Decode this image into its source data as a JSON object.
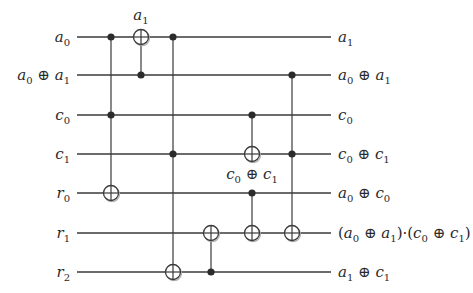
{
  "diagram": {
    "type": "reversible-logic-circuit",
    "wire_x_start": 77,
    "wire_x_end": 331,
    "wires": [
      {
        "id": "w0",
        "y": 37,
        "input": [
          {
            "v": "a",
            "s": "0"
          }
        ],
        "output": [
          {
            "v": "a",
            "s": "1"
          }
        ]
      },
      {
        "id": "w1",
        "y": 75,
        "input": [
          {
            "v": "a",
            "s": "0"
          },
          {
            "op": "⊕"
          },
          {
            "v": "a",
            "s": "1"
          }
        ],
        "output": [
          {
            "v": "a",
            "s": "0"
          },
          {
            "op": "⊕"
          },
          {
            "v": "a",
            "s": "1"
          }
        ]
      },
      {
        "id": "w2",
        "y": 115,
        "input": [
          {
            "v": "c",
            "s": "0"
          }
        ],
        "output": [
          {
            "v": "c",
            "s": "0"
          }
        ]
      },
      {
        "id": "w3",
        "y": 154,
        "input": [
          {
            "v": "c",
            "s": "1"
          }
        ],
        "output": [
          {
            "v": "c",
            "s": "0"
          },
          {
            "op": "⊕"
          },
          {
            "v": "c",
            "s": "1"
          }
        ]
      },
      {
        "id": "w4",
        "y": 193,
        "input": [
          {
            "v": "r",
            "s": "0"
          }
        ],
        "output": [
          {
            "v": "a",
            "s": "0"
          },
          {
            "op": "⊕"
          },
          {
            "v": "c",
            "s": "0"
          }
        ]
      },
      {
        "id": "w5",
        "y": 233,
        "input": [
          {
            "v": "r",
            "s": "1"
          }
        ],
        "output": [
          {
            "op": "("
          },
          {
            "v": "a",
            "s": "0"
          },
          {
            "op": "⊕"
          },
          {
            "v": "a",
            "s": "1"
          },
          {
            "op": ")·("
          },
          {
            "v": "c",
            "s": "0"
          },
          {
            "op": "⊕"
          },
          {
            "v": "c",
            "s": "1"
          },
          {
            "op": ")"
          }
        ]
      },
      {
        "id": "w6",
        "y": 272,
        "input": [
          {
            "v": "r",
            "s": "2"
          }
        ],
        "output": [
          {
            "v": "a",
            "s": "1"
          },
          {
            "op": "⊕"
          },
          {
            "v": "c",
            "s": "1"
          }
        ]
      }
    ],
    "gates": [
      {
        "name": "toffoli-1",
        "x": 111,
        "controls": [
          0,
          2
        ],
        "target": 4
      },
      {
        "name": "cnot-1",
        "x": 141,
        "controls": [
          1
        ],
        "target": 0,
        "annotation": {
          "position": "above",
          "dy": -17,
          "text": [
            {
              "v": "a",
              "s": "1"
            }
          ]
        }
      },
      {
        "name": "toffoli-2",
        "x": 173,
        "controls": [
          0,
          3
        ],
        "target": 6
      },
      {
        "name": "cnot-2",
        "x": 211,
        "controls": [
          6
        ],
        "target": 5
      },
      {
        "name": "cnot-3",
        "x": 252,
        "controls": [
          2
        ],
        "target": 3,
        "annotation": {
          "position": "below",
          "dy": 20,
          "text": [
            {
              "v": "c",
              "s": "0"
            },
            {
              "op": " ⊕ "
            },
            {
              "v": "c",
              "s": "1"
            }
          ]
        }
      },
      {
        "name": "cnot-4",
        "x": 252,
        "controls": [
          4
        ],
        "target": 5
      },
      {
        "name": "toffoli-3",
        "x": 292,
        "controls": [
          1,
          3
        ],
        "target": 5
      }
    ],
    "colors": {
      "wire": "#3a3a3a",
      "control_dot": "#2b2b2b",
      "text": "#2a2a2a",
      "background": "#ffffff"
    }
  }
}
